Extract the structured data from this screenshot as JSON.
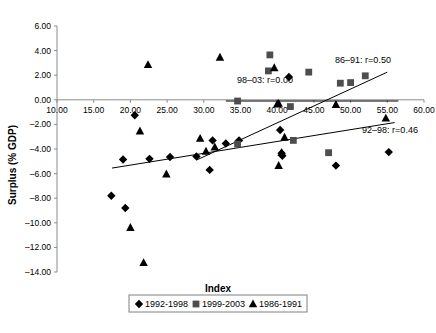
{
  "chart_data": {
    "type": "scatter",
    "title": "",
    "xlabel": "Index",
    "ylabel": "Surplus (% GDP)",
    "xlim": [
      10,
      60
    ],
    "ylim": [
      -14,
      6
    ],
    "xticks": [
      "10.00",
      "15.00",
      "20.00",
      "25.00",
      "30.00",
      "35.00",
      "40.00",
      "45.00",
      "50.00",
      "55.00",
      "60.00"
    ],
    "yticks": [
      "6.00",
      "4.00",
      "2.00",
      "0.00",
      "-2.00",
      "-4.00",
      "-6.00",
      "-8.00",
      "-10.00",
      "-12.00",
      "-14.00"
    ],
    "grid": false,
    "legend_position": "bottom",
    "series": [
      {
        "name": "1992-1998",
        "marker": "diamond",
        "color": "#000000",
        "points": [
          [
            20.6,
            -1.25
          ],
          [
            19.0,
            -4.85
          ],
          [
            22.6,
            -4.8
          ],
          [
            25.4,
            -4.65
          ],
          [
            29.0,
            -4.6
          ],
          [
            31.2,
            -3.3
          ],
          [
            33.0,
            -3.55
          ],
          [
            34.8,
            -3.3
          ],
          [
            30.8,
            -5.7
          ],
          [
            17.4,
            -7.8
          ],
          [
            19.3,
            -8.8
          ],
          [
            41.6,
            1.85
          ],
          [
            40.4,
            -2.45
          ],
          [
            40.6,
            -4.35
          ],
          [
            40.7,
            -4.55
          ],
          [
            48.0,
            -5.35
          ],
          [
            55.2,
            -4.25
          ]
        ]
      },
      {
        "name": "1999-2003",
        "marker": "square",
        "color": "#4d4d4d",
        "points": [
          [
            34.6,
            -0.1
          ],
          [
            34.6,
            -3.6
          ],
          [
            38.8,
            2.35
          ],
          [
            39.0,
            3.65
          ],
          [
            44.3,
            2.25
          ],
          [
            41.8,
            -0.55
          ],
          [
            42.2,
            -3.3
          ],
          [
            48.6,
            1.35
          ],
          [
            50.0,
            1.4
          ],
          [
            47.0,
            -4.3
          ],
          [
            52.0,
            1.95
          ]
        ]
      },
      {
        "name": "1986-1991",
        "marker": "triangle",
        "color": "#000000",
        "points": [
          [
            22.4,
            2.85
          ],
          [
            32.2,
            3.45
          ],
          [
            21.3,
            -2.55
          ],
          [
            24.9,
            -6.05
          ],
          [
            29.5,
            -3.15
          ],
          [
            31.5,
            -3.85
          ],
          [
            30.3,
            -4.2
          ],
          [
            20.0,
            -10.4
          ],
          [
            21.8,
            -13.25
          ],
          [
            39.6,
            2.6
          ],
          [
            40.0,
            -0.35
          ],
          [
            40.2,
            -0.3
          ],
          [
            41.0,
            -3.05
          ],
          [
            40.6,
            -4.3
          ],
          [
            40.2,
            -5.35
          ],
          [
            48.0,
            -0.4
          ],
          [
            54.8,
            -1.5
          ]
        ]
      }
    ],
    "trendlines": [
      {
        "name": "86-91",
        "label": "86–91: r=0.50",
        "r": 0.5,
        "x0": 29.0,
        "y0": -4.9,
        "x1": 55.0,
        "y1": 2.25
      },
      {
        "name": "98-03",
        "label": "98–03: r=0.00",
        "r": 0.0,
        "x0": 33.0,
        "y0": -0.1,
        "x1": 56.5,
        "y1": -0.1
      },
      {
        "name": "92-98",
        "label": "92–98: r=0.46",
        "r": 0.46,
        "x0": 17.5,
        "y0": -5.55,
        "x1": 56.0,
        "y1": -1.85
      }
    ],
    "annotations": [
      {
        "key": "86-91",
        "text": "86–91: r=0.50"
      },
      {
        "key": "98-03",
        "text": "98–03: r=0.00"
      },
      {
        "key": "92-98",
        "text": "92–98: r=0.46"
      }
    ],
    "legend": [
      {
        "label": "1992-1998",
        "marker": "diamond"
      },
      {
        "label": "1999-2003",
        "marker": "square"
      },
      {
        "label": "1986-1991",
        "marker": "triangle"
      }
    ]
  }
}
